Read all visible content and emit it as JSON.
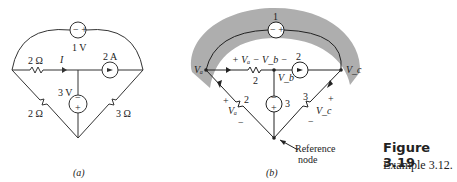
{
  "figure": {
    "title": "Figure 3.19",
    "subtitle": "Example 3.12."
  },
  "circuit_a": {
    "label": "(a)",
    "voltage_source_top": "1 V",
    "voltage_source_top_polarity": "− +",
    "resistor_top_left": "2 Ω",
    "current_label": "I",
    "current_source": "2 A",
    "voltage_source_middle": "3 V",
    "resistor_bottom_left": "2 Ω",
    "resistor_bottom_right": "3 Ω"
  },
  "circuit_b": {
    "label": "(b)",
    "supernode_label": "1",
    "current_source_label": "2",
    "voltage_drop_label": "+ Vₐ − V_b −",
    "node_a": "Vₐ",
    "node_b": "V_b",
    "node_c": "V_c",
    "resistor_middle": "2",
    "resistor_left": "2",
    "resistor_right": "3",
    "source_middle": "3",
    "left_voltage": "Vₐ",
    "right_voltage": "V_c",
    "reference_line1": "Reference",
    "reference_line2": "node"
  }
}
